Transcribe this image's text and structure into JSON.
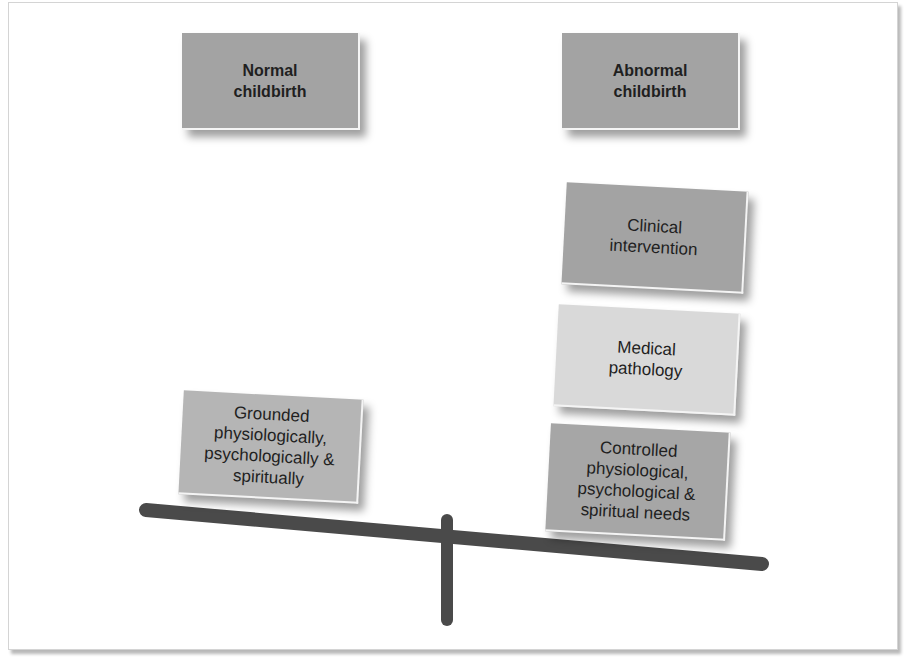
{
  "diagram": {
    "type": "balance-scale",
    "left_side": {
      "heading": "Normal\nchildbirth",
      "boxes": [
        {
          "label": "Grounded\nphysiologically,\npsychologically &\nspiritually",
          "color": "#b5b5b5"
        }
      ]
    },
    "right_side": {
      "heading": "Abnormal\nchildbirth",
      "boxes": [
        {
          "label": "Clinical\nintervention",
          "color": "#a3a3a3"
        },
        {
          "label": "Medical\npathology",
          "color": "#d9d9d9"
        },
        {
          "label": "Controlled\nphysiological,\npsychological &\nspiritual needs",
          "color": "#a6a6a6"
        }
      ]
    },
    "heading_color": "#a3a3a3",
    "beam_color": "#4a4a4a"
  }
}
